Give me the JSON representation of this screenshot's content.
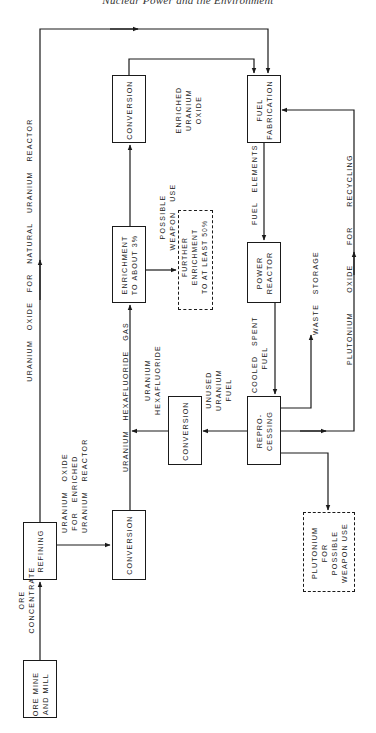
{
  "header": {
    "title": "Nuclear Power and the Environment"
  },
  "boxes": {
    "ore_mine": "ORE MINE\nAND MILL",
    "refining": "REFINING",
    "conversion_1": "CONVERSION",
    "enrichment": "ENRICHMENT\nTO ABOUT 3%",
    "conversion_2": "CONVERSION",
    "conversion_3": "CONVERSION",
    "fuel_fabrication": "FUEL\nFABRICATION",
    "power_reactor": "POWER\nREACTOR",
    "reprocessing": "REPRO-\nCESSING",
    "further_enrichment": "FURTHER\nENRICHMENT\nTO AT LEAST 50%",
    "plutonium_weapon": "PLUTONIUM\nFOR\nPOSSIBLE\nWEAPON USE"
  },
  "labels": {
    "ore_concentrate": "ORE\nCONCENTRATE",
    "natural_reactor": "URANIUM   OXIDE   FOR   NATURAL   URANIUM   REACTOR",
    "enriched_reactor": "URANIUM   OXIDE\nFOR   ENRICHED\nURANIUM   REACTOR",
    "hexafluoride_gas": "URANIUM   HEXAFLUORIDE   GAS",
    "uranium_hexafluoride": "URANIUM\nHEXAFLUORIDE",
    "unused_uranium": "UNUSED\nURANIUM\nFUEL",
    "possible_weapon": "POSSIBLE\nWEAPON   USE",
    "enriched_oxide": "ENRICHED\nURANIUM\nOXIDE",
    "fuel_elements": "FUEL   ELEMENTS",
    "cooled_spent": "COOLED   SPENT\nFUEL",
    "waste_storage": "WASTE   STORAGE",
    "plutonium_recycling": "PLUTONIUM      OXIDE      FOR      RECYCLING"
  },
  "colors": {
    "line": "#1a1a1a",
    "background": "#ffffff"
  }
}
